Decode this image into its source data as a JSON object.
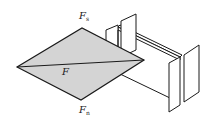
{
  "diagram": {
    "title": "",
    "type": "force-parallelogram-wedge",
    "colors": {
      "stroke": "#1a1a1a",
      "fill_rhombus": "#d4d4d4",
      "background": "#ffffff",
      "plate_fill": "#ffffff"
    },
    "labels": {
      "top": {
        "main": "F",
        "sub": "s"
      },
      "center": {
        "main": "F"
      },
      "bottom": {
        "main": "F",
        "sub": "n"
      }
    },
    "rhombus": {
      "left": [
        17,
        67
      ],
      "top": [
        82,
        28
      ],
      "right": [
        144,
        60
      ],
      "bottom": [
        81,
        100
      ]
    }
  }
}
